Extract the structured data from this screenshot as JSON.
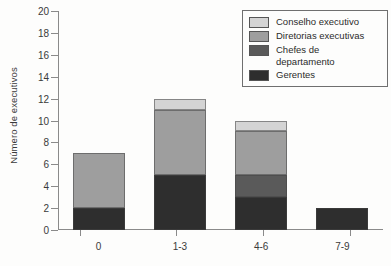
{
  "chart_data": {
    "type": "bar",
    "subtype": "stacked-vertical",
    "title": "",
    "xlabel": "",
    "ylabel": "Número de executivos",
    "categories": [
      "0",
      "1-3",
      "4-6",
      "7-9"
    ],
    "ylim": [
      0,
      20
    ],
    "ytick_step": 2,
    "yticks": [
      0,
      2,
      4,
      6,
      8,
      10,
      12,
      14,
      16,
      18,
      20
    ],
    "ytick_labels": [
      "0",
      "2",
      "4",
      "6",
      "8",
      "10",
      "12",
      "14",
      "16",
      "18",
      "20"
    ],
    "grid": false,
    "legend_position": "top-right",
    "stack_order_bottom_to_top": [
      "Gerentes",
      "Chefes de departamento",
      "Diretorias executivas",
      "Conselho executivo"
    ],
    "series": [
      {
        "name": "Gerentes",
        "color": "#2e2e2e",
        "values": [
          2,
          5,
          3,
          2
        ]
      },
      {
        "name": "Chefes de departamento",
        "color": "#5a5a5a",
        "values": [
          0,
          0,
          2,
          0
        ]
      },
      {
        "name": "Diretorias executivas",
        "color": "#9e9e9e",
        "values": [
          5,
          6,
          4,
          0
        ]
      },
      {
        "name": "Conselho executivo",
        "color": "#d4d4d4",
        "values": [
          0,
          1,
          1,
          0
        ]
      }
    ],
    "totals": [
      7,
      12,
      10,
      2
    ]
  },
  "legend": {
    "entries": [
      {
        "label": "Conselho executivo",
        "color": "#d4d4d4"
      },
      {
        "label": "Diretorias executivas",
        "color": "#9e9e9e"
      },
      {
        "label": "Chefes de departamento",
        "color": "#5a5a5a"
      },
      {
        "label": "Gerentes",
        "color": "#2e2e2e"
      }
    ]
  },
  "axes": {
    "y_title": "Número de executivos"
  }
}
